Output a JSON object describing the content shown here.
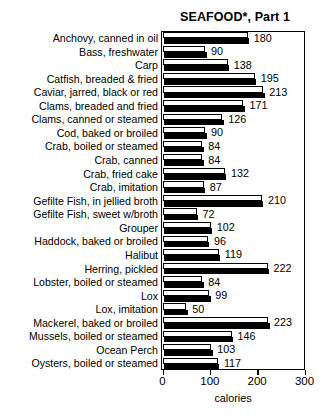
{
  "chart_data": {
    "type": "bar",
    "orientation": "horizontal",
    "title": "SEAFOOD*, Part 1",
    "xlabel": "calories",
    "ylabel": "",
    "xlim": [
      0,
      300
    ],
    "xticks": [
      0,
      100,
      200,
      300
    ],
    "grid": false,
    "legend": false,
    "categories": [
      "Anchovy, canned in oil",
      "Bass, freshwater",
      "Carp",
      "Catfish, breaded & fried",
      "Caviar, jarred, black or red",
      "Clams, breaded and fried",
      "Clams, canned or steamed",
      "Cod, baked or broiled",
      "Crab, boiled or steamed",
      "Crab, canned",
      "Crab, fried cake",
      "Crab, imitation",
      "Gefilte Fish, in jellied broth",
      "Gefilte Fish, sweet w/broth",
      "Grouper",
      "Haddock, baked or broiled",
      "Halibut",
      "Herring, pickled",
      "Lobster,  boiled or steamed",
      "Lox",
      "Lox,  imitation",
      "Mackerel, baked or broiled",
      "Mussels, boiled or steamed",
      "Ocean Perch",
      "Oysters, boiled or steamed"
    ],
    "values": [
      180,
      90,
      138,
      195,
      213,
      171,
      126,
      90,
      84,
      84,
      132,
      87,
      210,
      72,
      102,
      96,
      119,
      222,
      84,
      99,
      50,
      223,
      146,
      103,
      117
    ],
    "value_labels": [
      "180",
      "90",
      "138",
      "195",
      "213",
      "171",
      "126",
      "90",
      "84",
      "84",
      "132",
      "87",
      "210",
      "72",
      "102",
      "96",
      "119",
      "222",
      "84",
      "99",
      "50",
      "223",
      "146",
      "103",
      "117"
    ]
  }
}
